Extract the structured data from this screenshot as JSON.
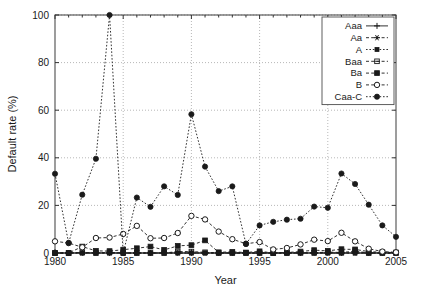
{
  "chart_data": {
    "type": "line",
    "title": "",
    "xlabel": "Year",
    "ylabel": "Default rate (%)",
    "xlim": [
      1980,
      2005
    ],
    "ylim": [
      0,
      100
    ],
    "xticks": [
      1980,
      1985,
      1990,
      1995,
      2000,
      2005
    ],
    "xtick_labels": [
      "1980",
      "1985",
      "1990",
      "1995",
      "2000",
      "2005"
    ],
    "yticks": [
      0,
      20,
      40,
      60,
      80,
      100
    ],
    "ytick_labels": [
      "0",
      "20",
      "40",
      "60",
      "80",
      "100"
    ],
    "grid": true,
    "legend_position": "top-right",
    "x": [
      1980,
      1981,
      1982,
      1983,
      1984,
      1985,
      1986,
      1987,
      1988,
      1989,
      1990,
      1991,
      1992,
      1993,
      1994,
      1995,
      1996,
      1997,
      1998,
      1999,
      2000,
      2001,
      2002,
      2003,
      2004,
      2005
    ],
    "series": [
      {
        "name": "Aaa",
        "marker": "plus",
        "linestyle": "solid",
        "color": "#1a1a1a",
        "values": [
          0,
          0,
          0,
          0,
          0,
          0,
          0,
          0,
          0,
          0,
          0,
          0,
          0,
          0,
          0,
          0,
          0,
          0,
          0,
          0,
          0,
          0,
          0,
          0,
          0,
          0
        ]
      },
      {
        "name": "Aa",
        "marker": "star",
        "linestyle": "dashed",
        "color": "#1a1a1a",
        "values": [
          0,
          0,
          0,
          0,
          0,
          0,
          0,
          0,
          0,
          0,
          0,
          0,
          0,
          0,
          0,
          0,
          0,
          0,
          0,
          0,
          0,
          0,
          0,
          0,
          0,
          0
        ]
      },
      {
        "name": "A",
        "marker": "square-small",
        "linestyle": "dotted",
        "color": "#1a1a1a",
        "values": [
          0,
          0,
          0,
          0,
          0,
          0,
          0,
          0,
          0,
          0,
          0,
          0,
          0,
          0,
          0,
          0,
          0,
          0,
          0,
          0,
          0,
          0,
          0,
          0,
          0,
          0
        ]
      },
      {
        "name": "Baa",
        "marker": "hexagram",
        "linestyle": "dashed",
        "color": "#1a1a1a",
        "values": [
          0,
          0,
          0.3,
          0,
          0.3,
          0,
          0,
          0,
          0,
          0.6,
          0.6,
          0.3,
          0,
          0,
          0,
          0,
          0,
          0,
          0.1,
          0.1,
          0.4,
          0.2,
          0.8,
          0,
          0,
          0
        ]
      },
      {
        "name": "Ba",
        "marker": "filled-square",
        "linestyle": "dashed",
        "color": "#1a1a1a",
        "values": [
          0,
          0,
          2.7,
          0.9,
          0.8,
          1.4,
          2,
          2.7,
          1.3,
          3,
          3.3,
          5.3,
          0.3,
          0.5,
          0.2,
          0.7,
          0,
          0.2,
          0.6,
          1.2,
          0.9,
          1.6,
          1.5,
          0.6,
          0.3,
          0.2
        ]
      },
      {
        "name": "B",
        "marker": "open-circle",
        "linestyle": "dashed",
        "color": "#1a1a1a",
        "values": [
          4.9,
          4.2,
          2.4,
          6.3,
          6.5,
          8,
          11.4,
          6.2,
          6.3,
          8.4,
          15.6,
          14.1,
          9,
          5.8,
          3.9,
          4.6,
          1.5,
          2.1,
          3.6,
          5.6,
          5,
          8.5,
          4.9,
          1.8,
          0.6,
          0.3
        ]
      },
      {
        "name": "Caa-C",
        "marker": "filled-circle",
        "linestyle": "dotted",
        "color": "#1a1a1a",
        "values": [
          33.3,
          4.2,
          24.5,
          39.6,
          100,
          0,
          23.3,
          19.4,
          28,
          24.4,
          58.3,
          36.3,
          26,
          28,
          3.8,
          11.6,
          13.1,
          14,
          14.4,
          19.5,
          19,
          33.4,
          29,
          20.3,
          11.6,
          6.8
        ]
      }
    ]
  },
  "legend": {
    "entries": [
      {
        "label": "Aaa"
      },
      {
        "label": "Aa"
      },
      {
        "label": "A"
      },
      {
        "label": "Baa"
      },
      {
        "label": "Ba"
      },
      {
        "label": "B"
      },
      {
        "label": "Caa-C"
      }
    ]
  }
}
